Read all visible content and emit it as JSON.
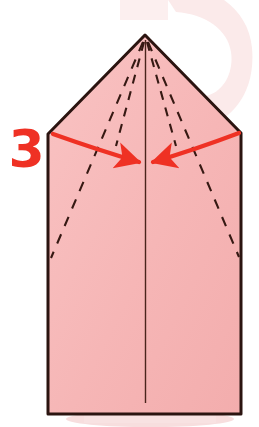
{
  "figure": {
    "kind": "origami-fold-diagram",
    "step_number": "3",
    "width": 259,
    "height": 427,
    "background_color": "#ffffff"
  },
  "colors": {
    "paper_fill": "#f6b6b6",
    "paper_fill_light": "#f9c5c5",
    "paper_outline": "#2b1410",
    "crease_dashed": "#3a1c16",
    "crease_solid": "#4a241c",
    "arrow_red": "#ef3124",
    "step_number_red": "#ef3124",
    "background_blob": "#fbe9e9",
    "shadow": "#f6dede"
  },
  "paper": {
    "name": "folded-paper-shape",
    "description": "Pentagon-shaped folded paper: rectangle body with pointed top",
    "outline_points": "145,35 241,133 241,414 48,414 48,134",
    "apex": {
      "x": 145,
      "y": 35
    },
    "left_shoulder": {
      "x": 48,
      "y": 134
    },
    "right_shoulder": {
      "x": 241,
      "y": 133
    },
    "bottom_left": {
      "x": 48,
      "y": 414
    },
    "bottom_right": {
      "x": 241,
      "y": 414
    }
  },
  "creases": {
    "center_line": {
      "name": "center-vertical-crease",
      "style": "solid",
      "x1": 145,
      "y1": 40,
      "x2": 145,
      "y2": 403
    },
    "dashed_lines": [
      {
        "name": "crease-inner-left",
        "style": "dashed",
        "x1": 144,
        "y1": 40,
        "x2": 116,
        "y2": 145
      },
      {
        "name": "crease-inner-right",
        "style": "dashed",
        "x1": 147,
        "y1": 40,
        "x2": 176,
        "y2": 145
      },
      {
        "name": "crease-outer-left",
        "style": "dashed",
        "x1": 143,
        "y1": 40,
        "x2": 51,
        "y2": 258
      },
      {
        "name": "crease-outer-right",
        "style": "dashed",
        "x1": 148,
        "y1": 40,
        "x2": 239,
        "y2": 257
      }
    ]
  },
  "arrow": {
    "name": "fold-direction-arrow",
    "color": "#ef3124",
    "description": "Double-headed red curved arrow pointing inward to the center crease",
    "left_half": {
      "name": "arrow-left-half",
      "start": {
        "x": 53,
        "y": 134
      },
      "control": {
        "x": 98,
        "y": 150
      },
      "tip": {
        "x": 145,
        "y": 163
      }
    },
    "right_half": {
      "name": "arrow-right-half",
      "start": {
        "x": 239,
        "y": 133
      },
      "control": {
        "x": 194,
        "y": 150
      },
      "tip": {
        "x": 147,
        "y": 163
      }
    }
  },
  "background_decor": {
    "blob": {
      "name": "background-blob",
      "description": "Faint pale pink swoosh in the upper right corner"
    },
    "shadow": {
      "name": "paper-drop-shadow",
      "description": "Faint pink shadow beneath the bottom edge of the paper"
    }
  }
}
